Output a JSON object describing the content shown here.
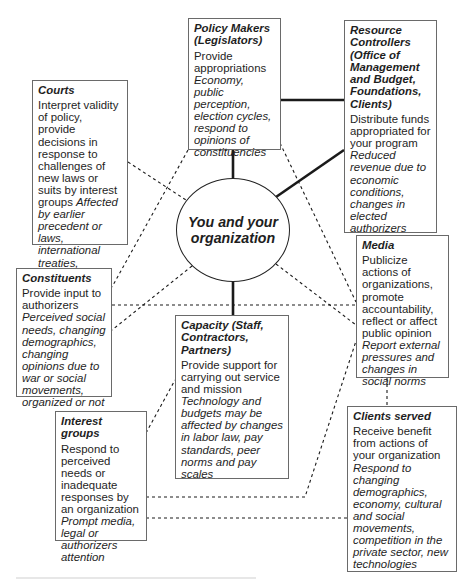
{
  "diagram": {
    "center": {
      "label": "You and your organization"
    },
    "stakeholders": [
      {
        "id": "policy-makers",
        "title": "Policy Makers (Legislators)",
        "role": "Provide appropriations",
        "influences": "Economy, public perception, election cycles, respond to opinions of constituencies"
      },
      {
        "id": "resource-controllers",
        "title": "Resource Controllers (Office of Management and Budget, Foundations, Clients)",
        "role": "Distribute funds appropriated for your program",
        "influences": "Reduced revenue due to economic conditions, changes in elected authorizers"
      },
      {
        "id": "courts",
        "title": "Courts",
        "role": "Interpret validity of policy, provide decisions in response to challenges of new laws or suits by interest groups",
        "influences": "Affected by earlier precedent or laws, international treaties, changing cultural norms"
      },
      {
        "id": "media",
        "title": "Media",
        "role": "Publicize actions of organizations, promote accountability, reflect or affect public opinion",
        "influences": "Report external pressures and changes in social norms"
      },
      {
        "id": "constituents",
        "title": "Constituents",
        "role": "Provide input to authorizers",
        "influences": "Perceived social needs, changing demographics, changing opinions due to war or social movements, organized or not"
      },
      {
        "id": "capacity",
        "title": "Capacity (Staff, Contractors, Partners)",
        "role": "Provide support for carrying out service and mission",
        "influences": "Technology and budgets may be affected by changes in labor law, pay standards, peer norms and pay scales"
      },
      {
        "id": "interest-groups",
        "title": "Interest groups",
        "role": "Respond to perceived needs or inadequate responses by an organization",
        "influences": "Prompt media, legal or authorizers attention"
      },
      {
        "id": "clients-served",
        "title": "Clients served",
        "role": "Receive benefit from actions of your organization",
        "influences": "Respond to changing demographics, economy, cultural and social movements, competition in the private sector, new technologies"
      }
    ],
    "connections": [
      {
        "from": "center",
        "to": "policy-makers",
        "style": "solid"
      },
      {
        "from": "center",
        "to": "resource-controllers",
        "style": "solid"
      },
      {
        "from": "policy-makers",
        "to": "resource-controllers",
        "style": "solid"
      },
      {
        "from": "center",
        "to": "capacity",
        "style": "solid"
      },
      {
        "from": "center",
        "to": "courts",
        "style": "dashed"
      },
      {
        "from": "center",
        "to": "constituents",
        "style": "dashed"
      },
      {
        "from": "center",
        "to": "media",
        "style": "dashed"
      },
      {
        "from": "policy-makers",
        "to": "constituents",
        "style": "dashed"
      },
      {
        "from": "policy-makers",
        "to": "media",
        "style": "dashed"
      },
      {
        "from": "constituents",
        "to": "media",
        "style": "dashed"
      },
      {
        "from": "media",
        "to": "clients-served",
        "style": "dashed"
      },
      {
        "from": "interest-groups",
        "to": "media",
        "style": "dashed"
      },
      {
        "from": "interest-groups",
        "to": "capacity",
        "style": "dashed"
      },
      {
        "from": "interest-groups",
        "to": "clients-served",
        "style": "dashed"
      }
    ]
  }
}
